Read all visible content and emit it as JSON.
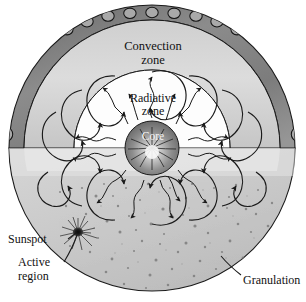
{
  "figure": {
    "title_internal": "Structure of the Sun",
    "background_color": "#ffffff",
    "width": 306,
    "height": 302
  },
  "labels": {
    "convection_zone_line1": "Convection",
    "convection_zone_line2": "zone",
    "radiative_zone_line1": "Radiative",
    "radiative_zone_line2": "zone",
    "core": "Core",
    "sunspot": "Sunspot",
    "active_region_line1": "Active",
    "active_region_line2": "region",
    "granulation": "Granulation"
  },
  "zones": [
    {
      "name": "core",
      "label": "Core",
      "fill": "#8d8d8d",
      "role": "innermost energy-generating sphere"
    },
    {
      "name": "radiative-zone",
      "label": "Radiative zone",
      "fill": "#ffffff",
      "role": "photon random-walk region"
    },
    {
      "name": "convection-zone",
      "label": "Convection zone",
      "fill": "#d8d8d8",
      "role": "rising and sinking convection cells"
    },
    {
      "name": "granule-ring",
      "label": "Granulation ring",
      "fill": "#7b7b7b",
      "role": "dark outer annulus of granule circles"
    },
    {
      "name": "photosphere",
      "label": "Granulation",
      "fill": "#c9c9c9",
      "role": "speckled visible surface"
    }
  ],
  "colors": {
    "outline": "#1a1a1a",
    "core_dark": "#6f6f6f",
    "core_light": "#f2f2f2",
    "convection_band": "#d9d9d9",
    "granule_band": "#8a8a8a",
    "granule_circle": "#a8a8a8",
    "photosphere": "#cdcdcd",
    "photosphere_speck": "#7a7a7a",
    "sunspot": "#141414",
    "leader_line": "#1a1a1a",
    "text": "#111111"
  },
  "geometry": {
    "center_x": 152,
    "center_y": 148,
    "outer_radius": 143,
    "granule_ring_outer_radius": 143,
    "granule_ring_inner_radius": 128,
    "convection_outer_radius": 128,
    "convection_inner_radius": 78,
    "radiative_outer_radius": 78,
    "core_radius": 27,
    "equator_y": 148,
    "granule_count": 38,
    "convection_cell_count": 18,
    "photon_ray_count": 16
  },
  "callouts": [
    {
      "name": "sunspot",
      "text": "Sunspot",
      "text_x": 43,
      "text_y": 242,
      "target_x": 78,
      "target_y": 232
    },
    {
      "name": "active-region",
      "text": "Active region",
      "text_x": 48,
      "text_y": 267,
      "target_x": 78,
      "target_y": 234
    },
    {
      "name": "granulation",
      "text": "Granulation",
      "text_x": 248,
      "text_y": 284,
      "target_x": 220,
      "target_y": 258
    }
  ]
}
